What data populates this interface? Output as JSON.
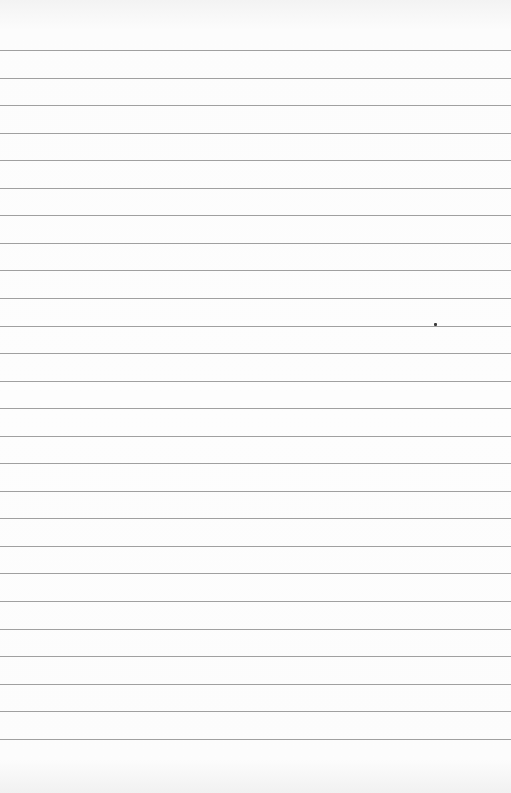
{
  "document": {
    "type": "lined-paper",
    "line_count": 26,
    "first_line_y": 50,
    "line_spacing": 27.55,
    "line_color": "#8f8f8f",
    "paper_color": "#fbfbfb",
    "text": ""
  },
  "marks": [
    {
      "x": 434,
      "y": 323,
      "color": "#3a3a3a"
    }
  ]
}
